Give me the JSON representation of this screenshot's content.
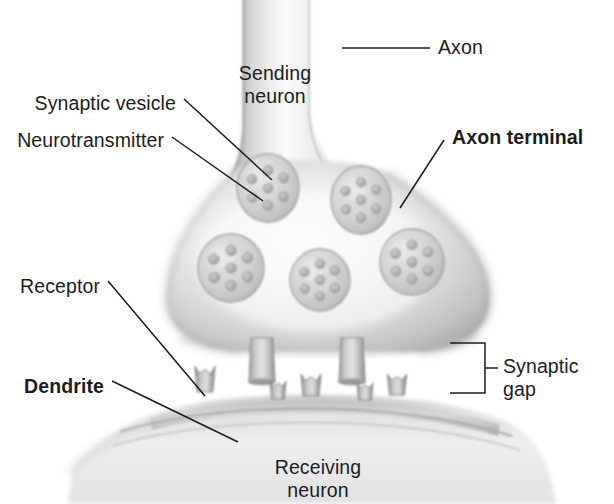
{
  "figure": {
    "background_color": "#ffffff",
    "ink_color": "#1c1c1c",
    "style": "grayscale airbrush illustration"
  },
  "labels": [
    {
      "id": "axon",
      "text": "Axon",
      "bold": false,
      "x": 438,
      "y": 36,
      "align": "left"
    },
    {
      "id": "sending-neuron",
      "text": "Sending\nneuron",
      "bold": false,
      "x": 275,
      "y": 62,
      "align": "center"
    },
    {
      "id": "synaptic-vesicle",
      "text": "Synaptic vesicle",
      "bold": false,
      "x": 176,
      "y": 92,
      "align": "right"
    },
    {
      "id": "neurotransmitter",
      "text": "Neurotransmitter",
      "bold": false,
      "x": 164,
      "y": 129,
      "align": "right"
    },
    {
      "id": "axon-terminal",
      "text": "Axon terminal",
      "bold": true,
      "x": 452,
      "y": 126,
      "align": "left"
    },
    {
      "id": "receptor",
      "text": "Receptor",
      "bold": false,
      "x": 100,
      "y": 275,
      "align": "right"
    },
    {
      "id": "dendrite",
      "text": "Dendrite",
      "bold": true,
      "x": 104,
      "y": 375,
      "align": "right"
    },
    {
      "id": "synaptic-gap",
      "text": "Synaptic\ngap",
      "bold": false,
      "x": 503,
      "y": 355,
      "align": "left"
    },
    {
      "id": "receiving-neuron",
      "text": "Receiving\nneuron",
      "bold": false,
      "x": 318,
      "y": 456,
      "align": "center"
    }
  ],
  "structures": {
    "axon": {
      "name": "axon stalk",
      "top_y": 0,
      "left_x": 240,
      "right_x": 312
    },
    "axon_terminal": {
      "name": "axon terminal bulb",
      "left_x": 165,
      "right_x": 492,
      "top_y": 150,
      "bottom_y": 350
    },
    "synaptic_vesicles": [
      {
        "cx": 268,
        "cy": 188,
        "rx": 31,
        "ry": 34,
        "dots": 7
      },
      {
        "cx": 361,
        "cy": 200,
        "rx": 30,
        "ry": 34,
        "dots": 7
      },
      {
        "cx": 231,
        "cy": 268,
        "rx": 33,
        "ry": 34,
        "dots": 7
      },
      {
        "cx": 320,
        "cy": 280,
        "rx": 30,
        "ry": 31,
        "dots": 7
      },
      {
        "cx": 412,
        "cy": 262,
        "rx": 32,
        "ry": 33,
        "dots": 7
      }
    ],
    "release_sites": [
      {
        "cx": 262,
        "top_y": 338,
        "bottom_y": 382,
        "top_w": 22,
        "bottom_w": 26
      },
      {
        "cx": 352,
        "top_y": 338,
        "bottom_y": 382,
        "top_w": 22,
        "bottom_w": 26
      }
    ],
    "receptors": [
      {
        "cx": 205,
        "y": 392,
        "w": 20,
        "h": 26
      },
      {
        "cx": 278,
        "y": 399,
        "w": 16,
        "h": 18
      },
      {
        "cx": 311,
        "y": 396,
        "w": 20,
        "h": 22
      },
      {
        "cx": 365,
        "y": 400,
        "w": 16,
        "h": 17
      },
      {
        "cx": 397,
        "y": 395,
        "w": 19,
        "h": 21
      }
    ],
    "dendrite": {
      "name": "receiving neuron membrane",
      "top_y": 398,
      "left_x": 75,
      "right_x": 540
    }
  },
  "leader_lines": [
    {
      "id": "axon-leader",
      "x1": 342,
      "y1": 48,
      "x2": 430,
      "y2": 48
    },
    {
      "id": "synaptic-vesicle-leader",
      "x1": 184,
      "y1": 99,
      "x2": 272,
      "y2": 180
    },
    {
      "id": "neurotransmitter-leader",
      "x1": 172,
      "y1": 137,
      "x2": 263,
      "y2": 201
    },
    {
      "id": "axon-terminal-leader",
      "x1": 444,
      "y1": 140,
      "x2": 400,
      "y2": 208
    },
    {
      "id": "receptor-leader",
      "x1": 108,
      "y1": 281,
      "x2": 205,
      "y2": 396
    },
    {
      "id": "dendrite-leader",
      "x1": 112,
      "y1": 381,
      "x2": 238,
      "y2": 442
    }
  ],
  "bracket": {
    "id": "synaptic-gap-bracket",
    "x_spine": 485,
    "x_arm_left": 450,
    "y_top": 343,
    "y_bottom": 393,
    "y_tick": 368,
    "x_tick_end": 498
  }
}
